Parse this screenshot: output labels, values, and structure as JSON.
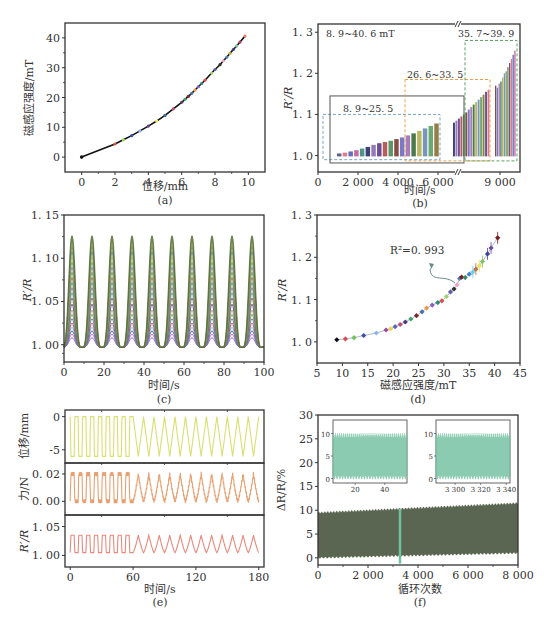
{
  "figure": {
    "panel_labels": [
      "(a)",
      "(b)",
      "(c)",
      "(d)",
      "(e)",
      "(f)"
    ]
  },
  "chart_data": [
    {
      "id": "a",
      "type": "scatter",
      "title": "",
      "xlabel": "位移/mm",
      "ylabel": "磁感应强度/mT",
      "xlim": [
        -1,
        11
      ],
      "ylim": [
        -5,
        45
      ],
      "xticks": [
        0,
        2,
        4,
        6,
        8,
        10
      ],
      "yticks": [
        0,
        10,
        20,
        30,
        40
      ],
      "grid": false,
      "points": [
        [
          0,
          0
        ],
        [
          2,
          4.4
        ],
        [
          2.5,
          5.8
        ],
        [
          3,
          7.2
        ],
        [
          3.5,
          8.8
        ],
        [
          4,
          10.4
        ],
        [
          4.5,
          12.1
        ],
        [
          5,
          14
        ],
        [
          5.5,
          16.2
        ],
        [
          6,
          18.4
        ],
        [
          6.2,
          19.4
        ],
        [
          6.4,
          20.4
        ],
        [
          6.6,
          21.4
        ],
        [
          6.8,
          22.5
        ],
        [
          7,
          23.6
        ],
        [
          7.2,
          24.7
        ],
        [
          7.4,
          25.8
        ],
        [
          7.8,
          28.2
        ],
        [
          8,
          29.4
        ],
        [
          8.3,
          31
        ],
        [
          8.5,
          32.3
        ],
        [
          8.7,
          33.5
        ],
        [
          8.9,
          34.8
        ],
        [
          9.1,
          36.1
        ],
        [
          9.3,
          37.3
        ],
        [
          9.5,
          38.6
        ],
        [
          9.8,
          40.6
        ]
      ],
      "marker_colors": [
        "#111111",
        "#e4553f",
        "#9bd35a",
        "#3b4ea8",
        "#8fb6e8",
        "#6a3f8f",
        "#f5e85a",
        "#3a6e9a",
        "#c94a7a",
        "#5d3a7a",
        "#3fa36b",
        "#7a2a2a",
        "#4a6fb0",
        "#e89a4a",
        "#8a5cc0",
        "#2a8a7a",
        "#d85050",
        "#a0d070",
        "#6060b0",
        "#303030",
        "#f0a0c0",
        "#5080c0",
        "#c0b040",
        "#404080",
        "#80c0a0",
        "#b04060",
        "#f08060"
      ]
    },
    {
      "id": "b",
      "type": "bar",
      "xlabel": "时间/s",
      "ylabel": "R′/R",
      "ylim": [
        0.96,
        1.32
      ],
      "yticks": [
        1.0,
        1.1,
        1.2,
        1.3
      ],
      "xticks": [
        "0",
        "2 000",
        "4 000",
        "6 000",
        "9 000"
      ],
      "axis_break": "between 6 000 and 9 000",
      "annotations": [
        {
          "text": "8. 9~40. 6 mT",
          "box": "none"
        },
        {
          "text": "8. 9~25. 5",
          "box": "black solid"
        },
        {
          "text": "26. 6~33. 5",
          "box": "orange dashed"
        },
        {
          "text": "35. 7~39. 9",
          "box": "green dashed"
        }
      ],
      "groups": [
        {
          "name": "8.9~25.5 mT",
          "peaks": [
            1.005,
            1.007,
            1.01,
            1.013,
            1.017,
            1.021,
            1.026,
            1.03,
            1.033,
            1.036,
            1.04,
            1.044,
            1.049,
            1.054,
            1.06,
            1.066,
            1.072,
            1.078
          ]
        },
        {
          "name": "26.6~33.5 mT",
          "peaks": [
            1.08,
            1.085,
            1.09,
            1.095,
            1.1,
            1.105,
            1.112,
            1.118,
            1.124,
            1.13,
            1.136,
            1.142,
            1.148,
            1.155,
            1.16
          ]
        },
        {
          "name": "35.7~39.9 mT",
          "peaks": [
            1.17,
            1.165,
            1.175,
            1.18,
            1.19,
            1.2,
            1.205,
            1.215,
            1.225,
            1.235,
            1.245,
            1.255
          ]
        }
      ],
      "bar_colors": [
        "#4a4a8a",
        "#e06a7a",
        "#4f62b0",
        "#c05a9a",
        "#3a8a7a",
        "#2a2a6a",
        "#8a6ab0",
        "#5a3a8a",
        "#b04a4a",
        "#4a8a5a",
        "#7a3a2a",
        "#6a6ac0",
        "#a070b0",
        "#3a6a3a",
        "#b0b050",
        "#6a8ab0",
        "#5aa060",
        "#8a7030"
      ]
    },
    {
      "id": "c",
      "type": "line",
      "xlabel": "时间/s",
      "ylabel": "R′/R",
      "xlim": [
        0,
        100
      ],
      "ylim": [
        0.98,
        1.15
      ],
      "xticks": [
        0,
        20,
        40,
        60,
        80,
        100
      ],
      "yticks": [
        "1. 00",
        "1. 05",
        "1. 10",
        "1. 15"
      ],
      "period_s": 10,
      "first_peak_s": 4,
      "baseline": 1.0,
      "series_peaks": [
        1.008,
        1.012,
        1.016,
        1.02,
        1.025,
        1.03,
        1.035,
        1.04,
        1.047,
        1.054,
        1.06,
        1.066,
        1.072,
        1.078,
        1.084,
        1.09,
        1.096,
        1.102,
        1.108,
        1.114,
        1.12,
        1.126
      ],
      "series_colors": [
        "#7a60c0",
        "#c070c0",
        "#4a4aa0",
        "#60a0c0",
        "#a04060",
        "#8060a0",
        "#40a080",
        "#c0a040",
        "#5050a0",
        "#a05050",
        "#60b070",
        "#9070b0",
        "#40a0a0",
        "#b07040",
        "#70a040",
        "#a080c0",
        "#60a060",
        "#c0c060",
        "#5080a0",
        "#80a060",
        "#a0b080",
        "#556b2f"
      ]
    },
    {
      "id": "d",
      "type": "scatter",
      "xlabel": "磁感应强度/mT",
      "ylabel": "R′/R",
      "xlim": [
        5,
        45
      ],
      "ylim": [
        0.95,
        1.3
      ],
      "xticks": [
        5,
        10,
        15,
        20,
        25,
        30,
        35,
        40,
        45
      ],
      "yticks": [
        "1. 0",
        "1. 1",
        "1. 2",
        "1. 3"
      ],
      "annotation": "R²=0. 993",
      "points": [
        [
          8.9,
          1.005
        ],
        [
          10.6,
          1.007
        ],
        [
          12.3,
          1.01
        ],
        [
          14.2,
          1.015
        ],
        [
          16.7,
          1.021
        ],
        [
          18.6,
          1.028
        ],
        [
          19.5,
          1.031
        ],
        [
          20.4,
          1.036
        ],
        [
          21.4,
          1.041
        ],
        [
          22.4,
          1.047
        ],
        [
          23.5,
          1.054
        ],
        [
          24.6,
          1.062
        ],
        [
          25.7,
          1.071
        ],
        [
          26.6,
          1.08
        ],
        [
          27.7,
          1.087
        ],
        [
          28.8,
          1.093
        ],
        [
          29.6,
          1.097
        ],
        [
          30.5,
          1.107
        ],
        [
          31.3,
          1.118
        ],
        [
          32,
          1.125
        ],
        [
          32.6,
          1.135
        ],
        [
          33.1,
          1.15
        ],
        [
          33.5,
          1.153
        ],
        [
          34.2,
          1.152
        ],
        [
          35,
          1.16
        ],
        [
          35.7,
          1.165
        ],
        [
          36.3,
          1.172
        ],
        [
          37,
          1.18
        ],
        [
          37.6,
          1.19
        ],
        [
          38.6,
          1.208
        ],
        [
          39.3,
          1.222
        ],
        [
          40.6,
          1.246
        ]
      ],
      "marker_colors": [
        "#111111",
        "#d0504a",
        "#6fbf5a",
        "#3b4ea8",
        "#8fb6e8",
        "#9a4a9a",
        "#f0d050",
        "#5a6ab0",
        "#c04a7a",
        "#4a3a7a",
        "#3fa36b",
        "#7a2a2a",
        "#4a6fb0",
        "#e89a4a",
        "#8a5cc0",
        "#2a8a7a",
        "#d85050",
        "#a0d070",
        "#6060b0",
        "#303030",
        "#f0a0c0",
        "#5080c0",
        "#7a1a1a",
        "#3a8a6a",
        "#4a80d0",
        "#6ad0f0",
        "#c07040",
        "#f0e060",
        "#80c060",
        "#4040a0",
        "#6a4aa0",
        "#7a1a1a"
      ]
    },
    {
      "id": "e",
      "type": "line",
      "xlabel": "时间/s",
      "xlim": [
        -5,
        185
      ],
      "xticks": [
        0,
        60,
        120,
        180
      ],
      "subplots": [
        {
          "ylabel": "位移/mm",
          "ylim": [
            -7,
            1
          ],
          "yticks": [
            "0",
            "-5"
          ],
          "color": "#d8e070",
          "low": -6,
          "high": 0
        },
        {
          "ylabel": "力/N",
          "ylim": [
            -0.01,
            0.028
          ],
          "yticks": [
            "0. 02",
            "0. 00"
          ],
          "color": "#e8a070",
          "low": 0.0,
          "high": 0.02
        },
        {
          "ylabel": "R′/R",
          "ylim": [
            0.98,
            1.07
          ],
          "yticks": [
            "1. 05",
            "1. 00"
          ],
          "color": "#e8887a",
          "low": 1.005,
          "high": 1.035
        }
      ],
      "square_wave_until_s": 60,
      "square_period_s": 7.5,
      "triangle_period_s": 10
    },
    {
      "id": "f",
      "type": "area",
      "xlabel": "循环次数",
      "ylabel": "ΔR/R/%",
      "xlim": [
        0,
        8000
      ],
      "ylim": [
        -1.5,
        30
      ],
      "xticks": [
        "0",
        "2 000",
        "4 000",
        "6 000",
        "8 000"
      ],
      "yticks": [
        0,
        5,
        10,
        15,
        20,
        25,
        30
      ],
      "band": {
        "low_start": 0,
        "low_end": 1,
        "high_start": 9.5,
        "high_end": 11.5,
        "color": "#5a6652"
      },
      "highlight_x": 3270,
      "highlight_color": "#6fc0a0",
      "insets": [
        {
          "xlim": [
            5,
            55
          ],
          "xticks": [
            "20",
            "40"
          ],
          "ylim": [
            -1,
            13
          ],
          "yticks": [
            "0",
            "5",
            "10"
          ],
          "color": "#6fc0a0"
        },
        {
          "xlim": [
            3285,
            3343
          ],
          "xticks": [
            "3 300",
            "3 320",
            "3 340"
          ],
          "ylim": [
            -1,
            13
          ],
          "yticks": [
            "0",
            "5",
            "10"
          ],
          "color": "#6fc0a0"
        }
      ]
    }
  ]
}
